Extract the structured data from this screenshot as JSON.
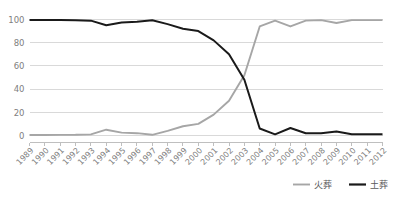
{
  "chart_data": {
    "type": "line",
    "title": "",
    "xlabel": "",
    "ylabel": "",
    "ylim": [
      0,
      100
    ],
    "yticks": [
      0,
      20,
      40,
      60,
      80,
      100
    ],
    "grid": true,
    "legend_position": "bottom-right",
    "categories": [
      "1989",
      "1990",
      "1991",
      "1992",
      "1993",
      "1994",
      "1995",
      "1996",
      "1997",
      "1998",
      "1999",
      "2000",
      "2001",
      "2002",
      "2003",
      "2004",
      "2005",
      "2006",
      "2007",
      "2008",
      "2009",
      "2010",
      "2011",
      "2012"
    ],
    "series": [
      {
        "name": "火葬",
        "color": "#a6a6a6",
        "values": [
          0.4,
          0.4,
          0.5,
          0.6,
          1.0,
          5.0,
          2.5,
          2.0,
          0.6,
          4.0,
          8.0,
          10.0,
          18.0,
          30.0,
          52.0,
          94.0,
          99.0,
          94.0,
          99.0,
          99.5,
          97.0,
          99.5,
          99.5,
          99.5
        ]
      },
      {
        "name": "土葬",
        "color": "#1a1a1a",
        "values": [
          99.6,
          99.6,
          99.5,
          99.4,
          99.0,
          95.0,
          97.5,
          98.0,
          99.4,
          96.0,
          92.0,
          90.0,
          82.0,
          70.0,
          48.0,
          6.0,
          1.0,
          6.5,
          2.0,
          2.0,
          3.5,
          1.0,
          1.0,
          1.0
        ]
      }
    ]
  },
  "legend": {
    "items": [
      {
        "label": "火葬",
        "color": "#a6a6a6"
      },
      {
        "label": "土葬",
        "color": "#1a1a1a"
      }
    ]
  }
}
